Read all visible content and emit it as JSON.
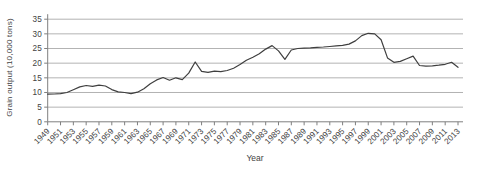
{
  "chart_data": {
    "type": "line",
    "xlabel": "Year",
    "ylabel": "Grain output (10,000 tons)",
    "x": [
      1949,
      1950,
      1951,
      1952,
      1953,
      1954,
      1955,
      1956,
      1957,
      1958,
      1959,
      1960,
      1961,
      1962,
      1963,
      1964,
      1965,
      1966,
      1967,
      1968,
      1969,
      1970,
      1971,
      1972,
      1973,
      1974,
      1975,
      1976,
      1977,
      1978,
      1979,
      1980,
      1981,
      1982,
      1983,
      1984,
      1985,
      1986,
      1987,
      1988,
      1989,
      1990,
      1991,
      1992,
      1993,
      1994,
      1995,
      1996,
      1997,
      1998,
      1999,
      2000,
      2001,
      2002,
      2003,
      2004,
      2005,
      2006,
      2007,
      2008,
      2009,
      2010,
      2011,
      2012,
      2013
    ],
    "series": [
      {
        "name": "Grain output",
        "values": [
          9.4,
          9.5,
          9.6,
          10.0,
          10.9,
          11.9,
          12.4,
          12.1,
          12.5,
          12.2,
          11.0,
          10.2,
          10.0,
          9.6,
          10.1,
          11.3,
          13.0,
          14.3,
          15.1,
          14.2,
          15.0,
          14.4,
          16.6,
          20.4,
          17.2,
          16.9,
          17.3,
          17.1,
          17.5,
          18.3,
          19.5,
          21.0,
          22.0,
          23.2,
          24.8,
          26.0,
          24.2,
          21.3,
          24.5,
          25.0,
          25.1,
          25.2,
          25.4,
          25.5,
          25.7,
          25.9,
          26.1,
          26.5,
          27.6,
          29.4,
          30.2,
          30.0,
          28.0,
          21.8,
          20.3,
          20.6,
          21.5,
          22.4,
          19.2,
          19.0,
          19.1,
          19.3,
          19.6,
          20.3,
          18.6
        ]
      }
    ],
    "ylim": [
      0,
      35
    ],
    "y_ticks": [
      0,
      5,
      10,
      15,
      20,
      25,
      30,
      35
    ],
    "x_tick_labels": [
      "1949",
      "1951",
      "1953",
      "1955",
      "1957",
      "1959",
      "1961",
      "1963",
      "1965",
      "1967",
      "1969",
      "1971",
      "1973",
      "1975",
      "1977",
      "1979",
      "1981",
      "1983",
      "1985",
      "1987",
      "1989",
      "1991",
      "1993",
      "1995",
      "1997",
      "1999",
      "2001",
      "2003",
      "2005",
      "2007",
      "2009",
      "2011",
      "2013"
    ],
    "grid": "horizontal",
    "legend": "none",
    "colors": {
      "line": "#3f3f3f",
      "grid": "#b3b3b3",
      "axis": "#7f7f7f",
      "text": "#3f3f3f",
      "background": "#ffffff"
    }
  }
}
